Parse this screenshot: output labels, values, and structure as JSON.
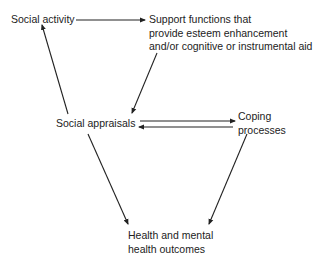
{
  "diagram": {
    "nodes": {
      "social_activity": {
        "label": "Social activity"
      },
      "support_functions": {
        "lines": [
          "Support functions that",
          "provide esteem enhancement",
          "and/or cognitive or instrumental aid"
        ]
      },
      "social_appraisals": {
        "label": "Social appraisals"
      },
      "coping_processes": {
        "lines": [
          "Coping",
          "processes"
        ]
      },
      "health_outcomes": {
        "lines": [
          "Health and mental",
          "health outcomes"
        ]
      }
    },
    "edges": [
      {
        "from": "Social activity",
        "to": "Support functions"
      },
      {
        "from": "Support functions",
        "to": "Social appraisals"
      },
      {
        "from": "Social appraisals",
        "to": "Social activity"
      },
      {
        "from": "Social appraisals",
        "to": "Coping processes"
      },
      {
        "from": "Coping processes",
        "to": "Social appraisals"
      },
      {
        "from": "Social appraisals",
        "to": "Health and mental health outcomes"
      },
      {
        "from": "Coping processes",
        "to": "Health and mental health outcomes"
      }
    ]
  }
}
